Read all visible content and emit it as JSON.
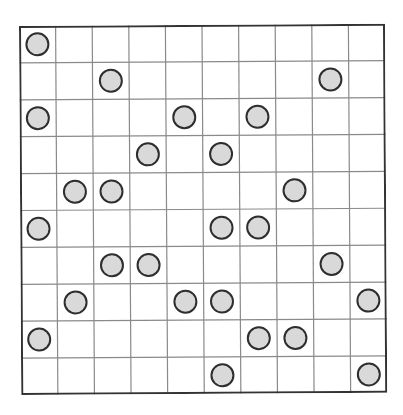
{
  "puzzle": {
    "rows": 10,
    "cols": 10,
    "colors": {
      "background": "#ffffff",
      "grid_line": "#8a8a8a",
      "border": "#333333",
      "circle_fill": "#d9d9d9",
      "circle_stroke": "#2e2e2e"
    },
    "circles": [
      {
        "row": 0,
        "col": 0
      },
      {
        "row": 1,
        "col": 2
      },
      {
        "row": 1,
        "col": 8
      },
      {
        "row": 2,
        "col": 0
      },
      {
        "row": 2,
        "col": 4
      },
      {
        "row": 2,
        "col": 6
      },
      {
        "row": 3,
        "col": 3
      },
      {
        "row": 3,
        "col": 5
      },
      {
        "row": 4,
        "col": 1
      },
      {
        "row": 4,
        "col": 2
      },
      {
        "row": 4,
        "col": 7
      },
      {
        "row": 5,
        "col": 0
      },
      {
        "row": 5,
        "col": 5
      },
      {
        "row": 5,
        "col": 6
      },
      {
        "row": 6,
        "col": 2
      },
      {
        "row": 6,
        "col": 3
      },
      {
        "row": 6,
        "col": 8
      },
      {
        "row": 7,
        "col": 1
      },
      {
        "row": 7,
        "col": 4
      },
      {
        "row": 7,
        "col": 5
      },
      {
        "row": 7,
        "col": 9
      },
      {
        "row": 8,
        "col": 0
      },
      {
        "row": 8,
        "col": 6
      },
      {
        "row": 8,
        "col": 7
      },
      {
        "row": 9,
        "col": 5
      },
      {
        "row": 9,
        "col": 9
      }
    ]
  }
}
